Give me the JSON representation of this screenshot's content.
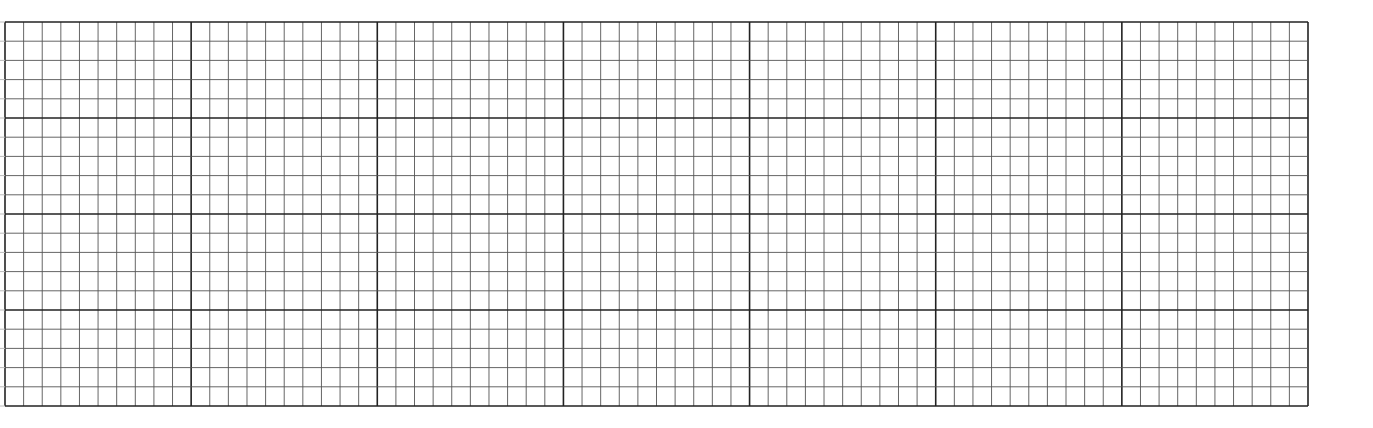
{
  "sheet": {
    "type": "graph-paper",
    "left": 5,
    "top": 22,
    "right": 1308,
    "bottom": 406,
    "cols": 70,
    "rows": 20,
    "major_every_col": 10,
    "major_every_row": 5,
    "colors": {
      "background": "#ffffff",
      "minor_line": "#555555",
      "major_line": "#222222",
      "border": "#222222"
    }
  }
}
